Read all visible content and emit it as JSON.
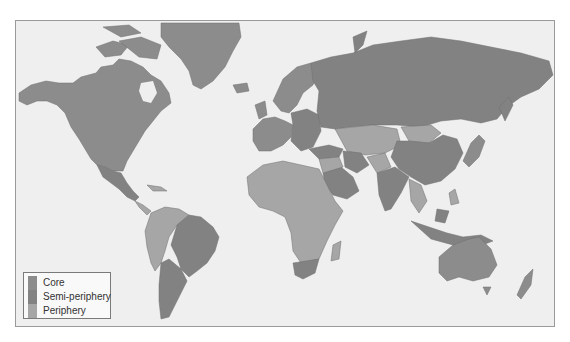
{
  "map": {
    "projection": "Mercator world map",
    "ocean_color": "#efefef",
    "border_color": "#9a9a9a"
  },
  "legend": {
    "items": [
      {
        "label": "Core",
        "color": "#8c8c8c"
      },
      {
        "label": "Semi-periphery",
        "color": "#828282"
      },
      {
        "label": "Periphery",
        "color": "#a6a6a6"
      }
    ]
  },
  "regions": {
    "core": [
      "North America (USA, Canada)",
      "Greenland",
      "Western Europe",
      "Scandinavia",
      "Japan",
      "Australia",
      "New Zealand"
    ],
    "semi_periphery": [
      "Russia",
      "China",
      "Brazil",
      "Argentina",
      "Mexico",
      "South Africa",
      "India",
      "Saudi Arabia",
      "Turkey",
      "Eastern Europe",
      "Indonesia",
      "Iran"
    ],
    "periphery": [
      "Most of Africa",
      "Central America",
      "Andean South America",
      "Central Asia",
      "Southeast Asia (parts)",
      "Mongolia",
      "Middle East (parts)"
    ]
  }
}
